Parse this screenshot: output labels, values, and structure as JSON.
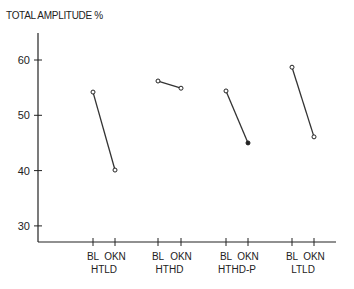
{
  "chart_data": {
    "type": "line",
    "title": "TOTAL AMPLITUDE %",
    "xlabel": "",
    "ylabel": "TOTAL AMPLITUDE %",
    "ylim": [
      27,
      65
    ],
    "yticks": [
      30,
      40,
      50,
      60
    ],
    "grid": false,
    "legend": null,
    "groups": [
      {
        "name": "HTLD",
        "conditions": [
          "BL",
          "OKN"
        ],
        "values": [
          54.2,
          40.1
        ],
        "markers": [
          "open",
          "open"
        ]
      },
      {
        "name": "HTHD",
        "conditions": [
          "BL",
          "OKN"
        ],
        "values": [
          56.2,
          54.9
        ],
        "markers": [
          "open",
          "open"
        ]
      },
      {
        "name": "HTHD-P",
        "conditions": [
          "BL",
          "OKN"
        ],
        "values": [
          54.4,
          45.0
        ],
        "markers": [
          "open",
          "filled"
        ]
      },
      {
        "name": "LTLD",
        "conditions": [
          "BL",
          "OKN"
        ],
        "values": [
          58.7,
          46.1
        ],
        "markers": [
          "open",
          "open"
        ]
      }
    ]
  },
  "layout": {
    "axis_color": "#222222",
    "line_color": "#333333",
    "y_axis_x": 38,
    "x_axis_y": 242,
    "x_axis_end": 336,
    "y_axis_top": 33,
    "y_px_at_60": 60,
    "px_per_unit": 5.53,
    "group_x": [
      [
        93,
        115
      ],
      [
        158,
        181
      ],
      [
        226,
        248
      ],
      [
        292,
        314
      ]
    ]
  }
}
